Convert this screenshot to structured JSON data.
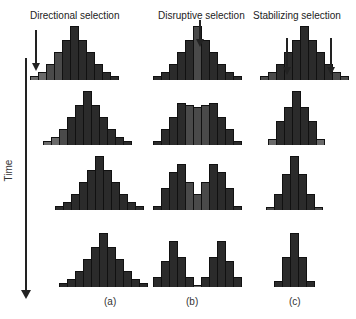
{
  "titles": {
    "a": "Directional selection",
    "b": "Disruptive selection",
    "c": "Stabilizing selection"
  },
  "panel_labels": {
    "a": "(a)",
    "b": "(b)",
    "c": "(c)"
  },
  "axis": {
    "label": "Time"
  },
  "colors": {
    "dark": "#2b2b2b",
    "mid": "#4a4a4a",
    "light": "#6a6a6a",
    "outline": "#111111"
  },
  "histograms": {
    "a": [
      {
        "left": 30,
        "bottom": 80,
        "heights": [
          4,
          8,
          16,
          28,
          40,
          54,
          40,
          28,
          16,
          8,
          4
        ],
        "shades": [
          "light",
          "light",
          "mid",
          "mid",
          "dark",
          "dark",
          "dark",
          "dark",
          "dark",
          "dark",
          "dark"
        ]
      },
      {
        "left": 43,
        "bottom": 145,
        "heights": [
          4,
          8,
          16,
          28,
          40,
          54,
          40,
          28,
          16,
          8,
          4
        ],
        "shades": [
          "light",
          "light",
          "mid",
          "dark",
          "dark",
          "dark",
          "dark",
          "dark",
          "dark",
          "dark",
          "dark"
        ]
      },
      {
        "left": 55,
        "bottom": 210,
        "heights": [
          4,
          8,
          16,
          28,
          40,
          54,
          40,
          28,
          16,
          8,
          4
        ],
        "shades": [
          "dark",
          "dark",
          "dark",
          "dark",
          "dark",
          "dark",
          "dark",
          "dark",
          "dark",
          "dark",
          "dark"
        ]
      },
      {
        "left": 59,
        "bottom": 287,
        "heights": [
          4,
          8,
          16,
          28,
          40,
          54,
          40,
          28,
          16,
          8,
          4
        ],
        "shades": [
          "dark",
          "dark",
          "dark",
          "dark",
          "dark",
          "dark",
          "dark",
          "dark",
          "dark",
          "dark",
          "dark"
        ]
      }
    ],
    "b": [
      {
        "left": 153,
        "bottom": 80,
        "heights": [
          4,
          8,
          16,
          28,
          40,
          54,
          40,
          28,
          16,
          8,
          4
        ],
        "shades": [
          "dark",
          "dark",
          "dark",
          "dark",
          "dark",
          "mid",
          "dark",
          "dark",
          "dark",
          "dark",
          "dark"
        ]
      },
      {
        "left": 153,
        "bottom": 145,
        "heights": [
          4,
          16,
          28,
          42,
          40,
          38,
          40,
          42,
          28,
          16,
          4
        ],
        "shades": [
          "dark",
          "dark",
          "dark",
          "dark",
          "mid",
          "mid",
          "mid",
          "dark",
          "dark",
          "dark",
          "dark"
        ]
      },
      {
        "left": 153,
        "bottom": 210,
        "heights": [
          4,
          22,
          38,
          46,
          28,
          16,
          28,
          46,
          38,
          22,
          4
        ],
        "shades": [
          "dark",
          "dark",
          "dark",
          "dark",
          "mid",
          "mid",
          "mid",
          "dark",
          "dark",
          "dark",
          "dark"
        ]
      },
      {
        "left": 153,
        "bottom": 287,
        "heights": [
          10,
          26,
          46,
          30,
          10,
          2,
          10,
          30,
          46,
          26,
          10
        ],
        "shades": [
          "dark",
          "dark",
          "dark",
          "dark",
          "dark",
          "light",
          "dark",
          "dark",
          "dark",
          "dark",
          "dark"
        ]
      }
    ],
    "c": [
      {
        "left": 260,
        "bottom": 80,
        "heights": [
          4,
          8,
          16,
          28,
          40,
          54,
          40,
          28,
          16,
          8,
          4
        ],
        "shades": [
          "mid",
          "mid",
          "dark",
          "dark",
          "dark",
          "dark",
          "dark",
          "dark",
          "dark",
          "mid",
          "mid"
        ]
      },
      {
        "left": 268,
        "bottom": 145,
        "heights": [
          6,
          24,
          38,
          54,
          38,
          24,
          6
        ],
        "shades": [
          "light",
          "dark",
          "dark",
          "dark",
          "dark",
          "dark",
          "light"
        ]
      },
      {
        "left": 266,
        "bottom": 210,
        "heights": [
          3,
          16,
          36,
          54,
          36,
          16,
          3
        ],
        "shades": [
          "mid",
          "dark",
          "dark",
          "dark",
          "dark",
          "dark",
          "mid"
        ]
      },
      {
        "left": 274,
        "bottom": 287,
        "heights": [
          6,
          30,
          54,
          30,
          6
        ],
        "shades": [
          "dark",
          "dark",
          "dark",
          "dark",
          "dark"
        ]
      }
    ]
  },
  "selection_arrows": [
    {
      "panel": "a",
      "x": 35,
      "top": 30,
      "height": 34
    },
    {
      "panel": "b",
      "x": 199,
      "top": 20,
      "height": 20
    },
    {
      "panel": "c",
      "x": 286,
      "top": 38,
      "height": 30
    },
    {
      "panel": "c",
      "x": 330,
      "top": 38,
      "height": 30
    }
  ]
}
